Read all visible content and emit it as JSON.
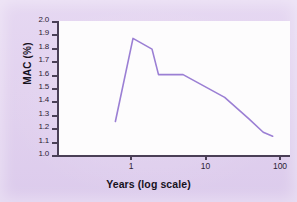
{
  "chart_data": {
    "type": "line",
    "title": "",
    "xlabel": "Years (log scale)",
    "ylabel": "MAC (%)",
    "xscale": "log",
    "xlim": [
      0.5,
      100
    ],
    "ylim": [
      1.0,
      2.0
    ],
    "grid": false,
    "legend": null,
    "x_ticks": [
      "1",
      "10",
      "100"
    ],
    "x_tick_values": [
      1,
      10,
      100
    ],
    "y_ticks": [
      "1.0",
      "1.1",
      "1.2",
      "1.3",
      "1.4",
      "1.5",
      "1.6",
      "1.7",
      "1.8",
      "1.9",
      "2.0"
    ],
    "y_tick_values": [
      1.0,
      1.1,
      1.2,
      1.3,
      1.4,
      1.5,
      1.6,
      1.7,
      1.8,
      1.9,
      2.0
    ],
    "series": [
      {
        "name": "MAC",
        "color": "#9b7fd4",
        "x": [
          0.58,
          1.0,
          1.8,
          2.2,
          4.7,
          17.0,
          36.0,
          56.0,
          75.0
        ],
        "y": [
          1.25,
          1.87,
          1.79,
          1.6,
          1.6,
          1.43,
          1.27,
          1.17,
          1.14
        ]
      }
    ]
  },
  "figure": {
    "background_color": "#e3d3f0",
    "plot_background_color": "#fdfcfd",
    "axis_color": "#4a3f56",
    "line_color": "#9b7fd4"
  }
}
